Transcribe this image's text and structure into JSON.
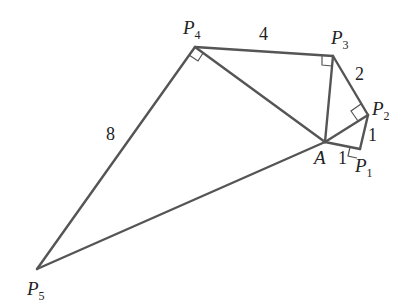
{
  "diagram": {
    "type": "geometry",
    "line_color": "#555555",
    "points": {
      "A": {
        "name": "A",
        "sub": "",
        "x": 325,
        "y": 142
      },
      "P1": {
        "name": "P",
        "sub": "1",
        "x": 360,
        "y": 149
      },
      "P2": {
        "name": "P",
        "sub": "2",
        "x": 368,
        "y": 115
      },
      "P3": {
        "name": "P",
        "sub": "3",
        "x": 333,
        "y": 56
      },
      "P4": {
        "name": "P",
        "sub": "4",
        "x": 195,
        "y": 47
      },
      "P5": {
        "name": "P",
        "sub": "5",
        "x": 37,
        "y": 269
      }
    },
    "segment_lengths": {
      "AP1": "1",
      "P1P2": "1",
      "P2P3": "2",
      "P3P4": "4",
      "P4P5": "8"
    },
    "right_angles": [
      "P1",
      "P2",
      "P3",
      "P4"
    ]
  }
}
